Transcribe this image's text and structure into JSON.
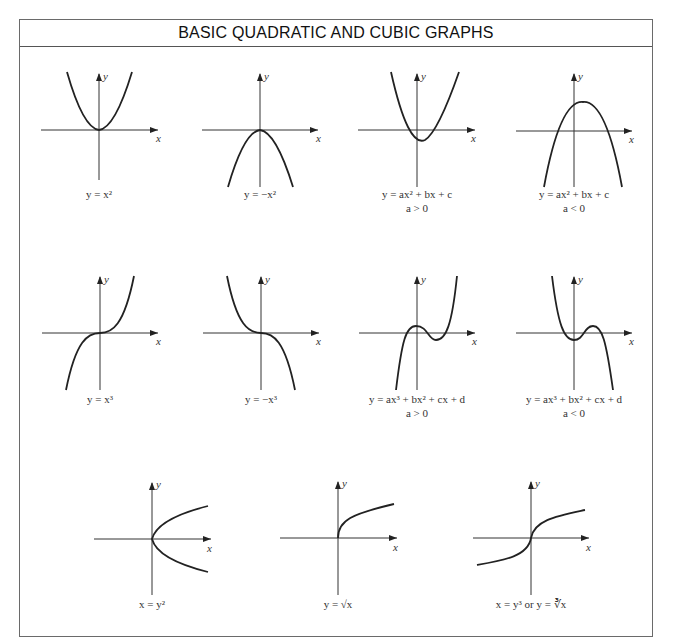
{
  "title": "BASIC QUADRATIC AND CUBIC GRAPHS",
  "axis_labels": {
    "x": "x",
    "y": "y"
  },
  "colors": {
    "line": "#222222",
    "axis": "#333333",
    "border": "#6a6a6a",
    "background": "#ffffff"
  },
  "graphs": [
    {
      "id": "y-eq-x2",
      "caption": "y = x²",
      "caption2": "",
      "row": 1,
      "col": 1
    },
    {
      "id": "y-eq-neg-x2",
      "caption": "y = −x²",
      "caption2": "",
      "row": 1,
      "col": 2
    },
    {
      "id": "quad-a-pos",
      "caption": "y = ax² + bx + c",
      "caption2": "a > 0",
      "row": 1,
      "col": 3
    },
    {
      "id": "quad-a-neg",
      "caption": "y = ax² + bx + c",
      "caption2": "a < 0",
      "row": 1,
      "col": 4
    },
    {
      "id": "y-eq-x3",
      "caption": "y = x³",
      "caption2": "",
      "row": 2,
      "col": 1
    },
    {
      "id": "y-eq-neg-x3",
      "caption": "y = −x³",
      "caption2": "",
      "row": 2,
      "col": 2
    },
    {
      "id": "cubic-a-pos",
      "caption": "y = ax³ + bx² + cx + d",
      "caption2": "a > 0",
      "row": 2,
      "col": 3
    },
    {
      "id": "cubic-a-neg",
      "caption": "y = ax³ + bx² + cx + d",
      "caption2": "a < 0",
      "row": 2,
      "col": 4
    },
    {
      "id": "x-eq-y2",
      "caption": "x = y²",
      "caption2": "",
      "row": 3,
      "col": 1
    },
    {
      "id": "y-eq-sqrt-x",
      "caption": "y = √x",
      "caption2": "",
      "row": 3,
      "col": 2
    },
    {
      "id": "x-eq-y3",
      "caption": "x = y³ or y = ∛x",
      "caption2": "",
      "row": 3,
      "col": 3
    }
  ]
}
